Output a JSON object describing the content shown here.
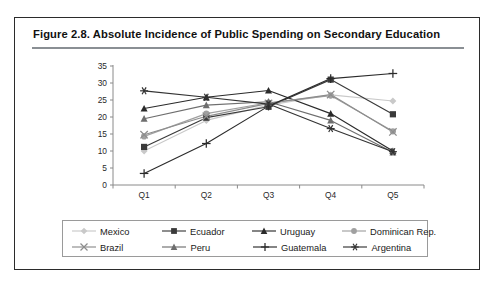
{
  "figure": {
    "title": "Figure 2.8.  Absolute Incidence of Public Spending on Secondary Education"
  },
  "chart_data": {
    "type": "line",
    "title": "Absolute Incidence of Public Spending on Secondary Education",
    "xlabel": "",
    "ylabel": "",
    "categories": [
      "Q1",
      "Q2",
      "Q3",
      "Q4",
      "Q5"
    ],
    "x_tick_labels": [
      "Q1",
      "Q2",
      "Q3",
      "Q4",
      "Q5"
    ],
    "y_tick_labels": [
      "0",
      "5",
      "10",
      "15",
      "20",
      "25",
      "30",
      "35"
    ],
    "ylim": [
      0,
      35
    ],
    "y_tick_step": 5,
    "grid": false,
    "legend_position": "bottom",
    "series": [
      {
        "name": "Mexico",
        "marker": "diamond",
        "color": "#c9c9c9",
        "values": [
          10.0,
          19.0,
          23.5,
          26.5,
          24.7
        ]
      },
      {
        "name": "Ecuador",
        "marker": "square",
        "color": "#3a3a3a",
        "values": [
          11.2,
          19.8,
          23.0,
          31.0,
          20.8
        ]
      },
      {
        "name": "Uruguay",
        "marker": "triangle",
        "color": "#2a2a2a",
        "values": [
          22.5,
          25.8,
          27.8,
          21.0,
          10.0
        ]
      },
      {
        "name": "Dominican Rep.",
        "marker": "circle",
        "color": "#a0a0a0",
        "values": [
          14.3,
          21.0,
          24.2,
          26.3,
          15.8
        ]
      },
      {
        "name": "Brazil",
        "marker": "x",
        "color": "#8d8d8d",
        "values": [
          14.8,
          20.2,
          24.0,
          26.6,
          15.6
        ]
      },
      {
        "name": "Peru",
        "marker": "triangle",
        "color": "#6e6e6e",
        "values": [
          19.5,
          23.5,
          24.5,
          19.0,
          9.6
        ]
      },
      {
        "name": "Guatemala",
        "marker": "plus",
        "color": "#2b2b2b",
        "values": [
          3.4,
          12.2,
          23.2,
          31.3,
          32.8
        ]
      },
      {
        "name": "Argentina",
        "marker": "asterisk",
        "color": "#333333",
        "values": [
          27.7,
          25.8,
          23.8,
          16.6,
          9.8
        ]
      }
    ]
  },
  "legend": {
    "rows": [
      [
        {
          "label": "Mexico",
          "marker": "diamond",
          "color": "#c9c9c9"
        },
        {
          "label": "Ecuador",
          "marker": "square",
          "color": "#3a3a3a"
        },
        {
          "label": "Uruguay",
          "marker": "triangle",
          "color": "#2a2a2a"
        },
        {
          "label": "Dominican Rep.",
          "marker": "circle",
          "color": "#a0a0a0"
        }
      ],
      [
        {
          "label": "Brazil",
          "marker": "x",
          "color": "#8d8d8d"
        },
        {
          "label": "Peru",
          "marker": "triangle",
          "color": "#6e6e6e"
        },
        {
          "label": "Guatemala",
          "marker": "plus",
          "color": "#2b2b2b"
        },
        {
          "label": "Argentina",
          "marker": "asterisk",
          "color": "#333333"
        }
      ]
    ]
  },
  "axis": {
    "tick_color": "#8a8a8a",
    "label_color": "#2a2a2a"
  }
}
